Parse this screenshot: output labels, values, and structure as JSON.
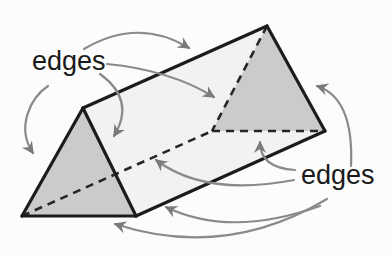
{
  "diagram": {
    "canvas": {
      "width": 392,
      "height": 256,
      "background": "#fcfcfc"
    },
    "colors": {
      "edge_stroke": "#1c1c1c",
      "dashed_stroke": "#262626",
      "arrow_stroke": "#8a8a8a",
      "arrow_head": "#7a7a7a",
      "triangle_face_fill": "#cbcbcb",
      "side_face_fill": "#f2f2f0",
      "label_color": "#1a1a1a"
    },
    "labels": [
      {
        "id": "edges-label-left",
        "text": "edges",
        "x": 32,
        "y": 70,
        "font_size": 27
      },
      {
        "id": "edges-label-right",
        "text": "edges",
        "x": 301,
        "y": 184,
        "font_size": 27
      }
    ],
    "vertices": {
      "A_front": [
        83,
        108
      ],
      "B_front": [
        22,
        216
      ],
      "C_front": [
        136,
        216
      ],
      "A_back": [
        267,
        26
      ],
      "B_back": [
        212,
        131
      ],
      "C_back": [
        325,
        131
      ]
    },
    "faces": [
      {
        "name": "side-face",
        "points": [
          "A_front",
          "A_back",
          "C_back",
          "C_front"
        ],
        "fill": "side_face_fill"
      },
      {
        "name": "back-triangle-face",
        "points": [
          "A_back",
          "B_back",
          "C_back"
        ],
        "fill": "triangle_face_fill"
      },
      {
        "name": "front-triangle-face",
        "points": [
          "A_front",
          "B_front",
          "C_front"
        ],
        "fill": "triangle_face_fill"
      }
    ],
    "dashed_edges": [
      {
        "name": "hidden-edge-bottom-left-long",
        "from": "B_front",
        "to": "B_back"
      },
      {
        "name": "hidden-edge-back-bottom",
        "from": "B_back",
        "to": "C_back"
      },
      {
        "name": "hidden-edge-back-left",
        "from": "A_back",
        "to": "B_back"
      }
    ],
    "solid_edges": [
      {
        "name": "edge-top-long",
        "from": "A_front",
        "to": "A_back"
      },
      {
        "name": "edge-bottom-long",
        "from": "C_front",
        "to": "C_back"
      },
      {
        "name": "edge-back-right",
        "from": "A_back",
        "to": "C_back"
      },
      {
        "name": "edge-front-left",
        "from": "A_front",
        "to": "B_front"
      },
      {
        "name": "edge-front-bottom",
        "from": "B_front",
        "to": "C_front"
      },
      {
        "name": "edge-front-right",
        "from": "C_front",
        "to": "A_front"
      }
    ],
    "arrows": [
      {
        "name": "arrow-to-top-long-edge",
        "from_label": "edges-label-left",
        "path": "M84,49 Q138,17 189,48"
      },
      {
        "name": "arrow-to-hidden-back-left-edge",
        "from_label": "edges-label-left",
        "path": "M107,64 Q170,70 214,97"
      },
      {
        "name": "arrow-to-front-left-edge",
        "from_label": "edges-label-left",
        "path": "M48,86 C30,98 16,128 33,153"
      },
      {
        "name": "arrow-to-front-right-edge",
        "from_label": "edges-label-left",
        "path": "M100,74 Q136,100 114,136"
      },
      {
        "name": "arrow-to-back-right-edge",
        "from_label": "edges-label-right",
        "path": "M351,166 Q354,98 317,86"
      },
      {
        "name": "arrow-to-hidden-back-bottom-edge",
        "from_label": "edges-label-right",
        "path": "M295,170 Q260,168 260,142"
      },
      {
        "name": "arrow-to-hidden-long-edge",
        "from_label": "edges-label-right",
        "path": "M294,180 Q205,197 156,160"
      },
      {
        "name": "arrow-to-front-bottom-edge",
        "from_label": "edges-label-right",
        "path": "M327,199 Q225,260 115,224"
      },
      {
        "name": "arrow-to-bottom-long-edge",
        "from_label": "edges-label-right",
        "path": "M320,206 Q230,238 166,207"
      }
    ],
    "stroke_widths": {
      "solid": 3.2,
      "dashed": 2.6,
      "arrow": 2.2
    },
    "dash_pattern": "8 6"
  }
}
